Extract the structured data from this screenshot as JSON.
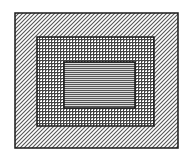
{
  "diagram": {
    "type": "nested-rectangles",
    "canvas": {
      "width": 192,
      "height": 161,
      "background": "#ffffff"
    },
    "stroke_color": "#1a1a1a",
    "layers": [
      {
        "name": "outer",
        "pattern": "diagonal-hatch",
        "bounds": {
          "x": 15,
          "y": 13,
          "w": 163,
          "h": 135
        },
        "pattern_color": "#555555"
      },
      {
        "name": "middle",
        "pattern": "crosshatch",
        "bounds": {
          "x": 37,
          "y": 37,
          "w": 117,
          "h": 89
        },
        "pattern_color": "#444444"
      },
      {
        "name": "inner",
        "pattern": "horizontal-lines",
        "bounds": {
          "x": 64,
          "y": 62,
          "w": 71,
          "h": 46
        },
        "pattern_color": "#555555"
      }
    ]
  }
}
